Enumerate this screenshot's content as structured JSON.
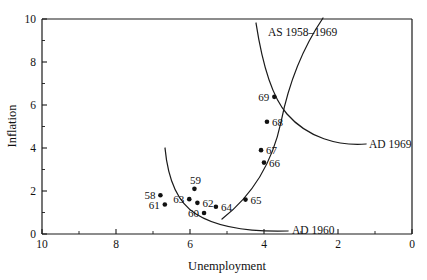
{
  "chart_data": {
    "type": "scatter",
    "title": "",
    "xlabel": "Unemployment",
    "ylabel": "Inflation",
    "xlim": [
      10,
      0
    ],
    "ylim": [
      0,
      10
    ],
    "x_axis_reversed": true,
    "grid": false,
    "legend_position": "inline-annotations",
    "x_ticks_major": [
      10,
      8,
      6,
      4,
      2,
      0
    ],
    "x_ticks_minor": [
      9,
      7,
      5,
      3,
      1
    ],
    "y_ticks_major": [
      0,
      2,
      4,
      6,
      8,
      10
    ],
    "y_ticks_minor": [
      1,
      3,
      5,
      7,
      9
    ],
    "x_tick_labels": [
      "10",
      "8",
      "6",
      "4",
      "2",
      "0"
    ],
    "y_tick_labels": [
      "0",
      "2",
      "4",
      "6",
      "8",
      "10"
    ],
    "points": [
      {
        "label": "58",
        "x": 6.8,
        "y": 1.8,
        "label_pos": "left"
      },
      {
        "label": "61",
        "x": 6.68,
        "y": 1.37,
        "label_pos": "left"
      },
      {
        "label": "63",
        "x": 6.02,
        "y": 1.62,
        "label_pos": "left"
      },
      {
        "label": "59",
        "x": 5.88,
        "y": 2.1,
        "label_pos": "above"
      },
      {
        "label": "62",
        "x": 5.8,
        "y": 1.45,
        "label_pos": "right"
      },
      {
        "label": "60",
        "x": 5.62,
        "y": 0.98,
        "label_pos": "left"
      },
      {
        "label": "64",
        "x": 5.3,
        "y": 1.27,
        "label_pos": "right"
      },
      {
        "label": "65",
        "x": 4.5,
        "y": 1.6,
        "label_pos": "right"
      },
      {
        "label": "66",
        "x": 4.0,
        "y": 3.32,
        "label_pos": "right"
      },
      {
        "label": "67",
        "x": 4.08,
        "y": 3.9,
        "label_pos": "right"
      },
      {
        "label": "68",
        "x": 3.92,
        "y": 5.22,
        "label_pos": "right"
      },
      {
        "label": "69",
        "x": 3.72,
        "y": 6.38,
        "label_pos": "left"
      }
    ],
    "curves": [
      {
        "name": "as-1958-1969",
        "label": "AS 1958–1969",
        "description": "Aggregate supply curve, upward sloping steeply to the right"
      },
      {
        "name": "ad-1969",
        "label": "AD 1969",
        "description": "Aggregate demand curve 1969, downward sloping convex"
      },
      {
        "name": "ad-1960",
        "label": "AD 1960",
        "description": "Aggregate demand curve 1960, downward sloping convex, lower left"
      }
    ]
  },
  "labels": {
    "ylabel": "Inflation",
    "xlabel": "Unemployment",
    "as_curve": "AS 1958–1969",
    "ad_1969": "AD 1969",
    "ad_1960": "AD 1960"
  },
  "colors": {
    "ink": "#111111",
    "background": "#ffffff"
  }
}
